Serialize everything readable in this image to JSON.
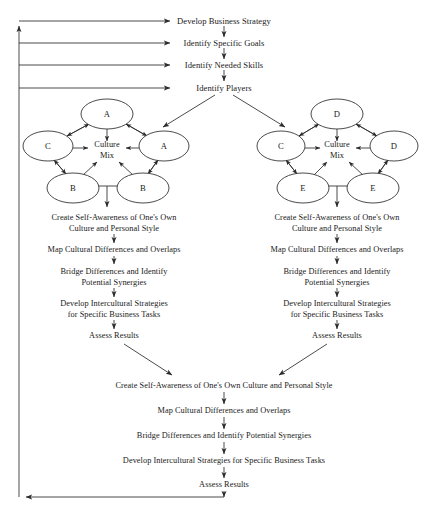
{
  "diagram": {
    "type": "flowchart",
    "stroke_color": "#2b2b2b",
    "text_color": "#1a1a1a",
    "background": "#ffffff"
  },
  "top_chain": [
    {
      "id": "develop-business-strategy",
      "label": "Develop Business Strategy",
      "x": 224,
      "y": 21
    },
    {
      "id": "identify-specific-goals",
      "label": "Identify Specific Goals",
      "x": 224,
      "y": 43
    },
    {
      "id": "identify-needed-skills",
      "label": "Identify Needed Skills",
      "x": 224,
      "y": 65
    },
    {
      "id": "identify-players",
      "label": "Identify Players",
      "x": 224,
      "y": 88
    }
  ],
  "clusters": [
    {
      "id": "left-culture-cluster",
      "center_label": "Culture\nMix",
      "center": {
        "x": 107,
        "y": 150
      },
      "nodes": [
        {
          "id": "left-node-top",
          "label": "A",
          "x": 107,
          "y": 114,
          "rx": 26,
          "ry": 15
        },
        {
          "id": "left-node-left",
          "label": "C",
          "x": 48,
          "y": 146,
          "rx": 25,
          "ry": 15
        },
        {
          "id": "left-node-right",
          "label": "A",
          "x": 164,
          "y": 146,
          "rx": 25,
          "ry": 15
        },
        {
          "id": "left-node-bottom-left",
          "label": "B",
          "x": 73,
          "y": 188,
          "rx": 26,
          "ry": 15
        },
        {
          "id": "left-node-bottom-right",
          "label": "B",
          "x": 143,
          "y": 188,
          "rx": 26,
          "ry": 15
        }
      ]
    },
    {
      "id": "right-culture-cluster",
      "center_label": "Culture\nMix",
      "center": {
        "x": 337,
        "y": 150
      },
      "nodes": [
        {
          "id": "right-node-top",
          "label": "D",
          "x": 337,
          "y": 114,
          "rx": 26,
          "ry": 15
        },
        {
          "id": "right-node-left",
          "label": "C",
          "x": 281,
          "y": 146,
          "rx": 24,
          "ry": 15
        },
        {
          "id": "right-node-right",
          "label": "D",
          "x": 394,
          "y": 146,
          "rx": 24,
          "ry": 15
        },
        {
          "id": "right-node-bottom-left",
          "label": "E",
          "x": 303,
          "y": 188,
          "rx": 26,
          "ry": 15
        },
        {
          "id": "right-node-bottom-right",
          "label": "E",
          "x": 373,
          "y": 188,
          "rx": 26,
          "ry": 15
        }
      ]
    }
  ],
  "left_column": {
    "id": "left-process-steps",
    "x": 114,
    "steps": [
      {
        "id": "left-step-1",
        "lines": [
          "Create Self-Awareness of One's Own",
          "Culture and Personal Style"
        ],
        "y": 218
      },
      {
        "id": "left-step-2",
        "lines": [
          "Map Cultural Differences and Overlaps"
        ],
        "y": 250
      },
      {
        "id": "left-step-3",
        "lines": [
          "Bridge Differences and Identify",
          "Potential Synergies"
        ],
        "y": 272
      },
      {
        "id": "left-step-4",
        "lines": [
          "Develop Intercultural Strategies",
          "for Specific Business Tasks"
        ],
        "y": 304
      },
      {
        "id": "left-step-5",
        "lines": [
          "Assess Results"
        ],
        "y": 336
      }
    ]
  },
  "right_column": {
    "id": "right-process-steps",
    "x": 337,
    "steps": [
      {
        "id": "right-step-1",
        "lines": [
          "Create Self-Awareness of One's Own",
          "Culture and Personal Style"
        ],
        "y": 218
      },
      {
        "id": "right-step-2",
        "lines": [
          "Map Cultural Differences and Overlaps"
        ],
        "y": 250
      },
      {
        "id": "right-step-3",
        "lines": [
          "Bridge Differences and Identify",
          "Potential Synergies"
        ],
        "y": 272
      },
      {
        "id": "right-step-4",
        "lines": [
          "Develop Intercultural Strategies",
          "for Specific Business Tasks"
        ],
        "y": 304
      },
      {
        "id": "right-step-5",
        "lines": [
          "Assess Results"
        ],
        "y": 336
      }
    ]
  },
  "merged_column": {
    "id": "merged-process-steps",
    "x": 224,
    "steps": [
      {
        "id": "merged-step-1",
        "label": "Create Self-Awareness of One's Own Culture and Personal Style",
        "y": 386
      },
      {
        "id": "merged-step-2",
        "label": "Map Cultural Differences and Overlaps",
        "y": 411
      },
      {
        "id": "merged-step-3",
        "label": "Bridge Differences and Identify Potential Synergies",
        "y": 436
      },
      {
        "id": "merged-step-4",
        "label": "Develop Intercultural Strategies for Specific Business Tasks",
        "y": 461
      },
      {
        "id": "merged-step-5",
        "label": "Assess Results",
        "y": 485
      }
    ]
  },
  "feedback_loop": {
    "id": "feedback-loop",
    "spine_x": 19,
    "top_y": 20,
    "bottom_y": 497,
    "branch_targets_y": [
      21,
      43,
      65,
      88
    ],
    "branch_end_x": 176,
    "description": "Bottom Assess Results returns up the left spine to all four top steps"
  }
}
